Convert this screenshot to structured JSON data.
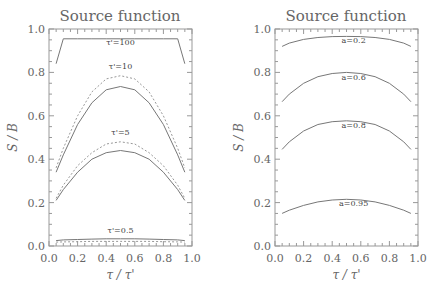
{
  "chart_data": [
    {
      "type": "line",
      "title": "Source function",
      "xlabel": "τ / τ'",
      "ylabel": "S / B",
      "xlim": [
        0.0,
        1.0
      ],
      "ylim": [
        0.0,
        1.0
      ],
      "xticks": [
        "0.0",
        "0.2",
        "0.4",
        "0.6",
        "0.8",
        "1.0"
      ],
      "yticks": [
        "0.0",
        "0.2",
        "0.4",
        "0.6",
        "0.8",
        "1.0"
      ],
      "grid": false,
      "x": [
        0.05,
        0.1,
        0.2,
        0.3,
        0.4,
        0.5,
        0.6,
        0.7,
        0.8,
        0.9,
        0.95
      ],
      "series": [
        {
          "name": "τ'=100 solid",
          "style": "solid",
          "values": [
            0.84,
            0.955,
            0.955,
            0.955,
            0.955,
            0.955,
            0.955,
            0.955,
            0.955,
            0.955,
            0.84
          ]
        },
        {
          "name": "τ'=10 solid",
          "style": "solid",
          "values": [
            0.34,
            0.42,
            0.56,
            0.66,
            0.72,
            0.735,
            0.72,
            0.66,
            0.56,
            0.42,
            0.34
          ]
        },
        {
          "name": "τ'=10 dashed",
          "style": "dashed",
          "values": [
            0.36,
            0.45,
            0.6,
            0.71,
            0.77,
            0.785,
            0.77,
            0.71,
            0.6,
            0.45,
            0.36
          ]
        },
        {
          "name": "τ'=5 solid",
          "style": "solid",
          "values": [
            0.21,
            0.26,
            0.34,
            0.4,
            0.43,
            0.44,
            0.43,
            0.4,
            0.34,
            0.26,
            0.21
          ]
        },
        {
          "name": "τ'=5 dashed",
          "style": "dashed",
          "values": [
            0.22,
            0.28,
            0.37,
            0.43,
            0.47,
            0.48,
            0.47,
            0.43,
            0.37,
            0.28,
            0.22
          ]
        },
        {
          "name": "τ'=0.5 solid",
          "style": "solid",
          "values": [
            0.025,
            0.028,
            0.03,
            0.032,
            0.033,
            0.033,
            0.033,
            0.032,
            0.03,
            0.028,
            0.025
          ]
        },
        {
          "name": "τ'=0.5 dashed",
          "style": "dashed",
          "values": [
            0.018,
            0.019,
            0.02,
            0.021,
            0.021,
            0.021,
            0.021,
            0.021,
            0.02,
            0.019,
            0.018
          ]
        }
      ],
      "annotations": [
        {
          "text": "τ'=100",
          "x": 0.5,
          "y": 0.925
        },
        {
          "text": "τ'=10",
          "x": 0.5,
          "y": 0.815
        },
        {
          "text": "τ'=5",
          "x": 0.5,
          "y": 0.51
        },
        {
          "text": "τ'=0.5",
          "x": 0.5,
          "y": 0.06
        }
      ]
    },
    {
      "type": "line",
      "title": "Source function",
      "xlabel": "τ / τ'",
      "ylabel": "S / B",
      "xlim": [
        0.0,
        1.0
      ],
      "ylim": [
        0.0,
        1.0
      ],
      "xticks": [
        "0.0",
        "0.2",
        "0.4",
        "0.6",
        "0.8",
        "1.0"
      ],
      "yticks": [
        "0.0",
        "0.2",
        "0.4",
        "0.6",
        "0.8",
        "1.0"
      ],
      "grid": false,
      "x": [
        0.05,
        0.1,
        0.2,
        0.3,
        0.4,
        0.5,
        0.6,
        0.7,
        0.8,
        0.9,
        0.95
      ],
      "series": [
        {
          "name": "a=0.2",
          "style": "solid",
          "values": [
            0.92,
            0.935,
            0.952,
            0.961,
            0.965,
            0.966,
            0.965,
            0.961,
            0.952,
            0.935,
            0.92
          ]
        },
        {
          "name": "a=0.6",
          "style": "solid",
          "values": [
            0.665,
            0.7,
            0.75,
            0.78,
            0.795,
            0.8,
            0.795,
            0.78,
            0.75,
            0.7,
            0.665
          ]
        },
        {
          "name": "a=0.8",
          "style": "solid",
          "values": [
            0.445,
            0.48,
            0.53,
            0.56,
            0.573,
            0.577,
            0.573,
            0.56,
            0.53,
            0.48,
            0.445
          ]
        },
        {
          "name": "a=0.95",
          "style": "solid",
          "values": [
            0.15,
            0.165,
            0.187,
            0.203,
            0.212,
            0.215,
            0.212,
            0.203,
            0.187,
            0.165,
            0.15
          ]
        }
      ],
      "annotations": [
        {
          "text": "a=0.2",
          "x": 0.55,
          "y": 0.935
        },
        {
          "text": "a=0.6",
          "x": 0.55,
          "y": 0.765
        },
        {
          "text": "a=0.8",
          "x": 0.55,
          "y": 0.545
        },
        {
          "text": "a=0.95",
          "x": 0.55,
          "y": 0.185
        }
      ]
    }
  ]
}
